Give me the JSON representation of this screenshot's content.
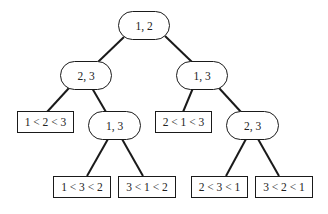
{
  "diagram": {
    "type": "decision-tree",
    "colors": {
      "stroke": "#1a1a1a",
      "text": "#222222",
      "background": "#ffffff"
    },
    "nodes": {
      "root": {
        "label": "1, 2",
        "kind": "comparison"
      },
      "l": {
        "label": "2, 3",
        "kind": "comparison"
      },
      "r": {
        "label": "1, 3",
        "kind": "comparison"
      },
      "ll": {
        "label": "1 < 2 < 3",
        "kind": "leaf"
      },
      "lr": {
        "label": "1, 3",
        "kind": "comparison"
      },
      "rl": {
        "label": "2 < 1 < 3",
        "kind": "leaf"
      },
      "rr": {
        "label": "2, 3",
        "kind": "comparison"
      },
      "lrl": {
        "label": "1 < 3 < 2",
        "kind": "leaf"
      },
      "lrr": {
        "label": "3 < 1 < 2",
        "kind": "leaf"
      },
      "rrl": {
        "label": "2 < 3 < 1",
        "kind": "leaf"
      },
      "rrr": {
        "label": "3 < 2 < 1",
        "kind": "leaf"
      }
    },
    "edges": [
      [
        "root",
        "l"
      ],
      [
        "root",
        "r"
      ],
      [
        "l",
        "ll"
      ],
      [
        "l",
        "lr"
      ],
      [
        "r",
        "rl"
      ],
      [
        "r",
        "rr"
      ],
      [
        "lr",
        "lrl"
      ],
      [
        "lr",
        "lrr"
      ],
      [
        "rr",
        "rrl"
      ],
      [
        "rr",
        "rrr"
      ]
    ]
  }
}
